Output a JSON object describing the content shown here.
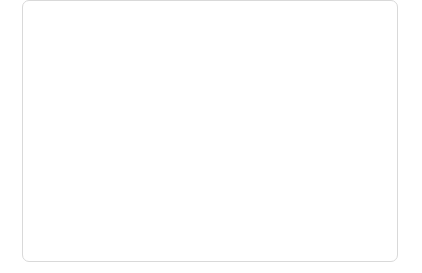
{
  "chart_data": {
    "type": "line",
    "title": "",
    "xlabel": "",
    "ylabel": "",
    "x": [
      1991,
      1992,
      1993,
      1994,
      1995,
      1996,
      1997,
      1998,
      1999,
      2000,
      2001,
      2002,
      2003,
      2004,
      2005,
      2006
    ],
    "categories": [
      "1991",
      "1992",
      "1993",
      "1994",
      "1995",
      "1996",
      "1997",
      "1998",
      "1999",
      "2000",
      "2001",
      "2002",
      "2003",
      "2004",
      "2005",
      "2006"
    ],
    "xlim": [
      1991,
      2006
    ],
    "ylim": [
      70,
      100
    ],
    "yticks": [
      70,
      75,
      80,
      85,
      90,
      95,
      100
    ],
    "ytick_labels": [
      "70%",
      "75%",
      "80%",
      "85%",
      "90%",
      "95%",
      "100%"
    ],
    "grid": true,
    "legend_position": "inline-right-labels",
    "series": [
      {
        "name": "수녀",
        "label": "수녀",
        "color": "#9a9a9a",
        "width": 1.1,
        "values": [
          100,
          99.6,
          99.2,
          98.8,
          98.4,
          98.2,
          98.1,
          97.9,
          97.8,
          97.6,
          97.4,
          97.2,
          97.0,
          96.8,
          96.7,
          96.5
        ]
      },
      {
        "name": "일반 여성",
        "label": "일반 여성",
        "color": "#5a5a5a",
        "width": 1.0,
        "values": [
          100,
          99.3,
          98.6,
          97.9,
          97.3,
          96.6,
          95.6,
          94.6,
          93.6,
          92.6,
          91.6,
          90.7,
          89.7,
          88.7,
          87.6,
          86.5
        ]
      },
      {
        "name": "수도사",
        "label": "수도사",
        "color": "#5a5a5a",
        "width": 1.0,
        "values": [
          100,
          99.3,
          98.6,
          98.0,
          97.6,
          94.9,
          94.2,
          93.4,
          92.4,
          91.3,
          90.1,
          88.9,
          87.6,
          86.3,
          85.1,
          84.0
        ]
      },
      {
        "name": "일반 남성",
        "label": "일반 남성",
        "color": "#3a3a3a",
        "width": 1.1,
        "values": [
          100,
          98.3,
          96.6,
          94.9,
          93.2,
          91.5,
          89.8,
          88.1,
          86.4,
          84.6,
          82.9,
          81.2,
          79.4,
          77.7,
          75.9,
          74.1
        ]
      }
    ],
    "annotations": [
      {
        "text": "수녀",
        "x_px": 360,
        "y_px": 61
      },
      {
        "text": "일반 여성",
        "x_px": 355,
        "y_px": 91
      },
      {
        "text": "수도사",
        "x_px": 357,
        "y_px": 139
      },
      {
        "text": "일반 남성",
        "x_px": 290,
        "y_px": 181
      }
    ]
  }
}
